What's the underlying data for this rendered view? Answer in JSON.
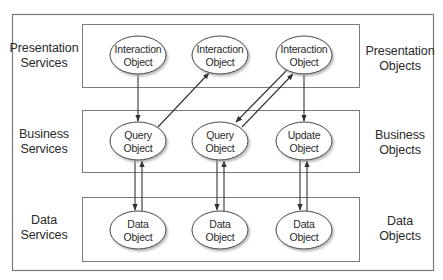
{
  "diagram": {
    "layers": [
      {
        "id": "presentation",
        "left_label": [
          "Presentation",
          "Services"
        ],
        "right_label": [
          "Presentation",
          "Objects"
        ],
        "nodes": [
          {
            "id": "io1",
            "label": [
              "Interaction",
              "Object"
            ]
          },
          {
            "id": "io2",
            "label": [
              "Interaction",
              "Object"
            ]
          },
          {
            "id": "io3",
            "label": [
              "Interaction",
              "Object"
            ]
          }
        ]
      },
      {
        "id": "business",
        "left_label": [
          "Business",
          "Services"
        ],
        "right_label": [
          "Business",
          "Objects"
        ],
        "nodes": [
          {
            "id": "qo1",
            "label": [
              "Query",
              "Object"
            ]
          },
          {
            "id": "qo2",
            "label": [
              "Query",
              "Object"
            ]
          },
          {
            "id": "uo1",
            "label": [
              "Update",
              "Object"
            ]
          }
        ]
      },
      {
        "id": "data",
        "left_label": [
          "Data",
          "Services"
        ],
        "right_label": [
          "Data",
          "Objects"
        ],
        "nodes": [
          {
            "id": "do1",
            "label": [
              "Data",
              "Object"
            ]
          },
          {
            "id": "do2",
            "label": [
              "Data",
              "Object"
            ]
          },
          {
            "id": "do3",
            "label": [
              "Data",
              "Object"
            ]
          }
        ]
      }
    ],
    "edges": [
      {
        "from": "io1",
        "to": "qo1"
      },
      {
        "from": "qo1",
        "to": "io2"
      },
      {
        "from": "io3",
        "to": "qo2"
      },
      {
        "from": "qo2",
        "to": "io3"
      },
      {
        "from": "io3",
        "to": "uo1"
      },
      {
        "from": "qo1",
        "to": "do1"
      },
      {
        "from": "do1",
        "to": "qo1"
      },
      {
        "from": "qo2",
        "to": "do2"
      },
      {
        "from": "do2",
        "to": "qo2"
      },
      {
        "from": "uo1",
        "to": "do3"
      },
      {
        "from": "do3",
        "to": "uo1"
      }
    ],
    "colors": {
      "line": "#4a4a4a",
      "frame": "#7a7a7a",
      "ellipse_fill": "#ffffff",
      "shadow": "#bdbdbd"
    }
  }
}
